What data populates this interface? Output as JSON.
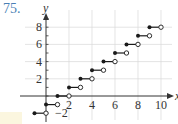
{
  "problem": {
    "number": "75."
  },
  "chart_data": {
    "type": "line",
    "subtype": "step",
    "title": "",
    "xlabel": "x",
    "ylabel": "y",
    "xlim": [
      -1.2,
      10.8
    ],
    "ylim": [
      -2.5,
      9.5
    ],
    "grid": true,
    "x_ticks": [
      2,
      4,
      6,
      8,
      10
    ],
    "y_ticks": [
      -2,
      2,
      4,
      6,
      8
    ],
    "x_tick_labels": [
      "2",
      "4",
      "6",
      "8",
      "10"
    ],
    "y_tick_labels": [
      "−2",
      "2",
      "4",
      "6",
      "8"
    ],
    "segments": [
      {
        "x_start": -1,
        "x_end": 0,
        "y": -2,
        "start": "closed",
        "end": "open"
      },
      {
        "x_start": 0,
        "x_end": 1,
        "y": -1,
        "start": "closed",
        "end": "open"
      },
      {
        "x_start": 1,
        "x_end": 2,
        "y": 0,
        "start": "closed",
        "end": "open"
      },
      {
        "x_start": 2,
        "x_end": 3,
        "y": 1,
        "start": "closed",
        "end": "open"
      },
      {
        "x_start": 3,
        "x_end": 4,
        "y": 2,
        "start": "closed",
        "end": "open"
      },
      {
        "x_start": 4,
        "x_end": 5,
        "y": 3,
        "start": "closed",
        "end": "open"
      },
      {
        "x_start": 5,
        "x_end": 6,
        "y": 4,
        "start": "closed",
        "end": "open"
      },
      {
        "x_start": 6,
        "x_end": 7,
        "y": 5,
        "start": "closed",
        "end": "open"
      },
      {
        "x_start": 7,
        "x_end": 8,
        "y": 6,
        "start": "closed",
        "end": "open"
      },
      {
        "x_start": 8,
        "x_end": 9,
        "y": 7,
        "start": "closed",
        "end": "open"
      },
      {
        "x_start": 9,
        "x_end": 10,
        "y": 8,
        "start": "closed",
        "end": "open"
      }
    ]
  },
  "colors": {
    "problem_number": "#4a7fb5",
    "axis": "#333333",
    "grid": "#d8d8d8",
    "line": "#1a1a1a"
  }
}
